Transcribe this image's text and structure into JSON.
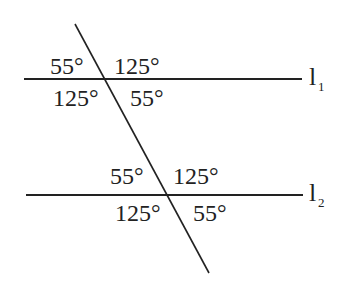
{
  "diagram": {
    "lines": {
      "l1": {
        "name": "l",
        "subscript": "1"
      },
      "l2": {
        "name": "l",
        "subscript": "2"
      }
    },
    "intersection1": {
      "top_left": "55°",
      "top_right": "125°",
      "bottom_left": "125°",
      "bottom_right": "55°"
    },
    "intersection2": {
      "top_left": "55°",
      "top_right": "125°",
      "bottom_left": "125°",
      "bottom_right": "55°"
    },
    "colors": {
      "stroke": "#222222",
      "background": "#ffffff"
    }
  }
}
